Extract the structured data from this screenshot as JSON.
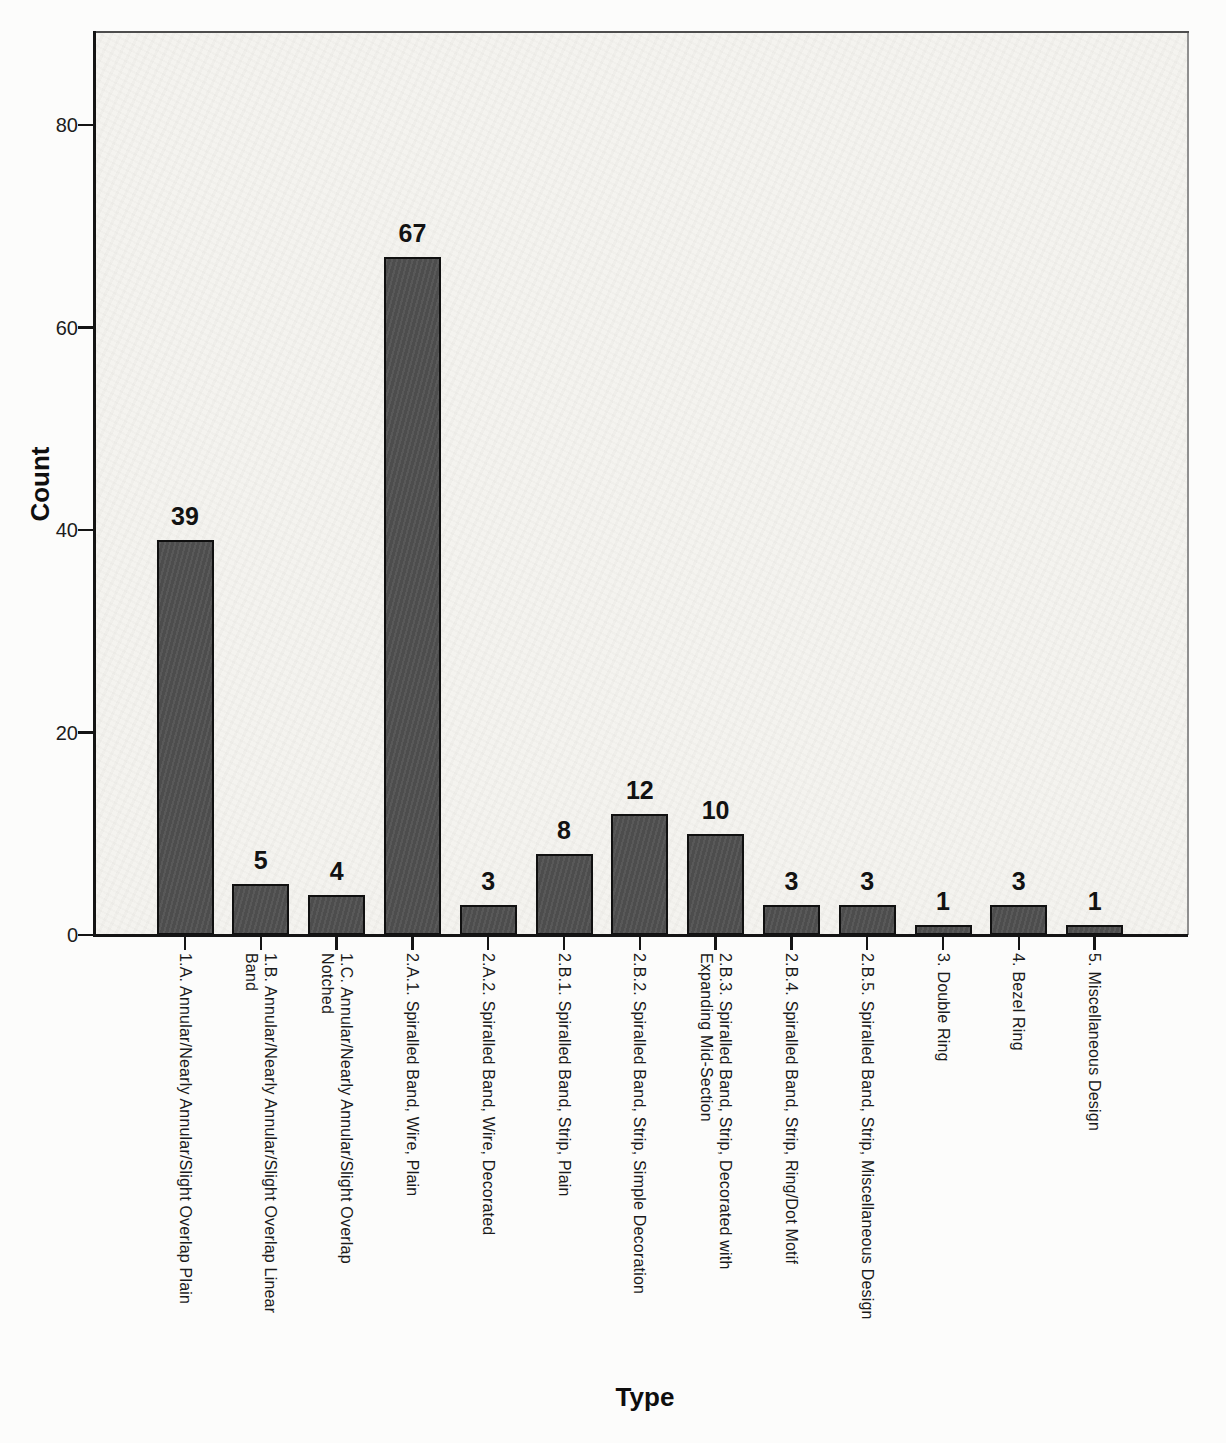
{
  "chart_data": {
    "type": "bar",
    "title": "",
    "xlabel": "Type",
    "ylabel": "Count",
    "categories": [
      "1.A. Annular/Nearly Annular/Slight Overlap Plain",
      "1.B. Annular/Nearly Annular/Slight Overlap Linear\nBand",
      "1.C. Annular/Nearly Annular/Slight Overlap\nNotched",
      "2.A.1. Spiralled Band, Wire, Plain",
      "2.A.2. Spiralled Band, Wire, Decorated",
      "2.B.1. Spiralled Band, Strip, Plain",
      "2.B.2. Spiralled Band, Strip, Simple Decoration",
      "2.B.3. Spiralled Band, Strip, Decorated with\nExpanding Mid-Section",
      "2.B.4. Spiralled Band, Strip, Ring/Dot Motif",
      "2.B.5. Spiralled Band, Strip, Miscellaneous Design",
      "3. Double Ring",
      "4. Bezel Ring",
      "5. Miscellaneous Design"
    ],
    "values": [
      39,
      5,
      4,
      67,
      3,
      8,
      12,
      10,
      3,
      3,
      1,
      3,
      1
    ],
    "bar_value_labels": [
      "39",
      "5",
      "4",
      "67",
      "3",
      "8",
      "12",
      "10",
      "3",
      "3",
      "1",
      "3",
      "1"
    ],
    "yticks": [
      0,
      20,
      40,
      60,
      80
    ],
    "ylim": [
      0,
      89
    ],
    "grid": false,
    "legend": null,
    "colors": {
      "bar_fill": "#515151",
      "bar_border": "#101010",
      "plot_background": "#f4f3ef",
      "axis_line": "#141414",
      "frame_top": "#4d4d4d",
      "frame_right": "#8f8f8f",
      "text": "#1a1a1a"
    }
  }
}
